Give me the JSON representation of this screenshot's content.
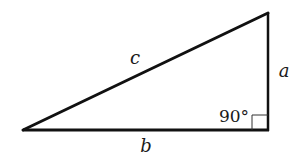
{
  "diagram": {
    "type": "right-triangle",
    "stroke_color": "#111111",
    "vertices": {
      "left": [
        23,
        130
      ],
      "right_angle": [
        268,
        130
      ],
      "top": [
        268,
        13
      ]
    },
    "labels": {
      "hypotenuse": "c",
      "vertical_side": "a",
      "base": "b",
      "right_angle": "90°"
    }
  }
}
